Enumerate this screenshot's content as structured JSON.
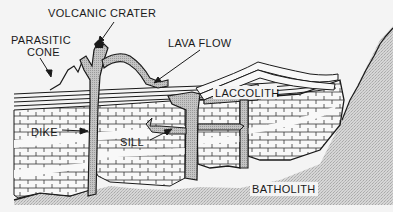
{
  "diagram": {
    "labels": {
      "volcanic_crater": "VOLCANIC CRATER",
      "parasitic_cone_line1": "PARASITIC",
      "parasitic_cone_line2": "CONE",
      "lava_flow": "LAVA FLOW",
      "laccolith": "LACCOLITH",
      "dike": "DIKE",
      "sill": "SILL",
      "batholith": "BATHOLITH"
    },
    "colors": {
      "background": "#f4f4f4",
      "ink": "#1a1a1a",
      "magma_fill": "#b8b8b8",
      "batholith_fill": "#cfcfcf",
      "strata_fill": "#f8f8f8"
    }
  }
}
